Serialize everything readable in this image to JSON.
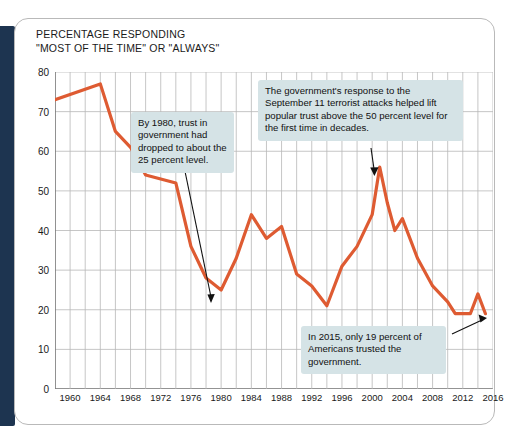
{
  "title": {
    "line1": "PERCENTAGE RESPONDING",
    "line2": "\"MOST OF THE TIME\" OR \"ALWAYS\""
  },
  "colors": {
    "line": "#de5b32",
    "note_background": "#d5e3e6",
    "grid": "#b7b7b7",
    "axis": "#6f6f6f",
    "spine": "#1d3450",
    "card_border": "#b9b9b9"
  },
  "annotations": [
    {
      "id": "note-1980",
      "text": "By 1980, trust in government had dropped to about the 25 percent level.",
      "target_year": 1980,
      "target_value": 25
    },
    {
      "id": "note-911",
      "text": "The government's response to the September 11 terrorist attacks helped lift popular trust above the 50 percent level for the first time in decades.",
      "target_year": 2001,
      "target_value": 56
    },
    {
      "id": "note-2015",
      "text": "In 2015, only 19 percent of Americans trusted the government.",
      "target_year": 2015,
      "target_value": 19
    }
  ],
  "chart_data": {
    "type": "line",
    "title": "PERCENTAGE RESPONDING \"MOST OF THE TIME\" OR \"ALWAYS\"",
    "xlabel": "",
    "ylabel": "",
    "xlim": [
      1958,
      2016
    ],
    "ylim": [
      0,
      80
    ],
    "yticks": [
      0,
      10,
      20,
      30,
      40,
      50,
      60,
      70,
      80
    ],
    "xticks": [
      1960,
      1964,
      1968,
      1972,
      1976,
      1980,
      1984,
      1988,
      1992,
      1996,
      2000,
      2004,
      2008,
      2012,
      2016
    ],
    "grid": true,
    "legend": false,
    "series": [
      {
        "name": "Trust in government",
        "color": "#de5b32",
        "x": [
          1958,
          1964,
          1966,
          1968,
          1970,
          1972,
          1974,
          1976,
          1978,
          1980,
          1982,
          1984,
          1986,
          1988,
          1990,
          1992,
          1994,
          1996,
          1998,
          2000,
          2001,
          2002,
          2003,
          2004,
          2006,
          2008,
          2010,
          2011,
          2013,
          2014,
          2015
        ],
        "values": [
          73,
          77,
          65,
          61,
          54,
          53,
          52,
          36,
          28,
          25,
          33,
          44,
          38,
          41,
          29,
          26,
          21,
          31,
          36,
          44,
          56,
          47,
          40,
          43,
          33,
          26,
          22,
          19,
          19,
          24,
          19
        ]
      }
    ]
  }
}
